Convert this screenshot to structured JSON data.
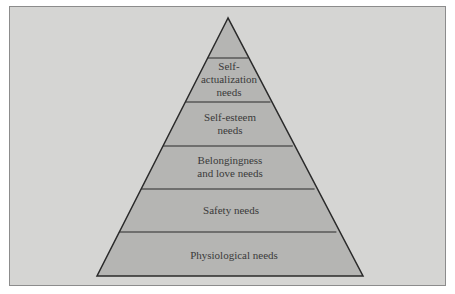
{
  "diagram": {
    "type": "pyramid",
    "levels": [
      {
        "label": "",
        "lines": []
      },
      {
        "label": "Self-actualization needs",
        "lines": [
          "Self-",
          "actualization",
          "needs"
        ]
      },
      {
        "label": "Self-esteem needs",
        "lines": [
          "Self-esteem",
          "needs"
        ]
      },
      {
        "label": "Belongingness and love needs",
        "lines": [
          "Belongingness",
          "and love needs"
        ]
      },
      {
        "label": "Safety needs",
        "lines": [
          "Safety needs"
        ]
      },
      {
        "label": "Physiological needs",
        "lines": [
          "Physiological needs"
        ]
      }
    ],
    "colors": {
      "background": "#d5d5d3",
      "fill": "#b5b5b3",
      "stroke": "#2a2a2a",
      "frame": "#8c8c8c"
    }
  },
  "labels": {
    "l1a": "Self-",
    "l1b": "actualization",
    "l1c": "needs",
    "l2a": "Self-esteem",
    "l2b": "needs",
    "l3a": "Belongingness",
    "l3b": "and love needs",
    "l4": "Safety needs",
    "l5": "Physiological needs"
  }
}
